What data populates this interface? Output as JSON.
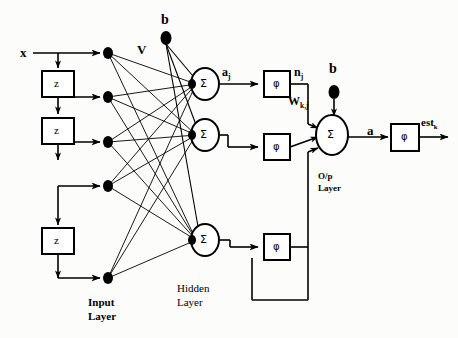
{
  "figure": {
    "background_color": "#fcfcfa",
    "stroke_color": "#000000"
  },
  "labels": {
    "input_signal": "x",
    "delay_block": "z",
    "weights_input_hidden": "V",
    "weights_hidden_output": "W",
    "weights_hidden_output_sub": "k,j",
    "bias_hidden": "b",
    "bias_output": "b",
    "sum_symbol": "Σ",
    "activation_symbol": "φ",
    "hidden_sum_out": "a",
    "hidden_sum_out_sub": "j",
    "hidden_act_out": "n",
    "hidden_act_out_sub": "j",
    "output_sum_out": "a",
    "network_output": "est",
    "network_output_sub": "k",
    "input_layer_line1": "Input",
    "input_layer_line2": "Layer",
    "hidden_layer_line1": "Hidden",
    "hidden_layer_line2": "Layer",
    "output_layer_line1": "O/p",
    "output_layer_line2": "Layer"
  },
  "layers": {
    "input": {
      "name": "Input Layer",
      "node_count": 5,
      "nodes_y": [
        53,
        97,
        142,
        186,
        278
      ],
      "node_x": 108,
      "delay_blocks": [
        {
          "label": "z",
          "x": 42,
          "y": 71,
          "w": 32,
          "h": 26
        },
        {
          "label": "z",
          "x": 42,
          "y": 118,
          "w": 32,
          "h": 26
        },
        {
          "label": "z",
          "x": 42,
          "y": 228,
          "w": 32,
          "h": 26
        }
      ]
    },
    "hidden": {
      "name": "Hidden Layer",
      "neuron_count": 3,
      "neurons_y": [
        84,
        135,
        240
      ],
      "neuron_x": 205,
      "activation_boxes_y": [
        84,
        147,
        247
      ],
      "activation_box_x": 264
    },
    "output": {
      "name": "O/p Layer",
      "neuron_count": 1,
      "neuron_x": 332,
      "neuron_y": 135,
      "activation_box_x": 404,
      "activation_box_y": 137
    }
  },
  "bias_nodes": [
    {
      "label": "b",
      "x": 166,
      "y": 38,
      "targets": "hidden"
    },
    {
      "label": "b",
      "x": 334,
      "y": 92,
      "targets": "output"
    }
  ]
}
